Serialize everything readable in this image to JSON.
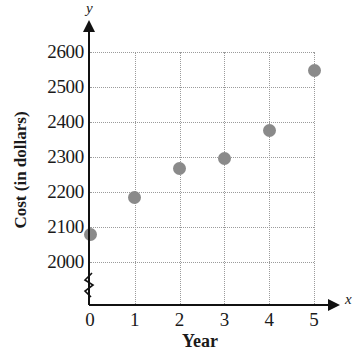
{
  "chart_data": {
    "type": "scatter",
    "title": "",
    "xlabel": "Year",
    "ylabel": "Cost (in dollars)",
    "x_axis_letter": "x",
    "y_axis_letter": "y",
    "x": [
      0,
      1,
      2,
      3,
      4,
      5
    ],
    "values": [
      2080,
      2185,
      2267,
      2295,
      2375,
      2548
    ],
    "series": [
      {
        "name": "Cost",
        "points": [
          {
            "x": 0,
            "y": 2080
          },
          {
            "x": 1,
            "y": 2185
          },
          {
            "x": 2,
            "y": 2267
          },
          {
            "x": 3,
            "y": 2295
          },
          {
            "x": 4,
            "y": 2375
          },
          {
            "x": 5,
            "y": 2548
          }
        ]
      }
    ],
    "xticklabels": [
      "0",
      "1",
      "2",
      "3",
      "4",
      "5"
    ],
    "yticklabels": [
      "2000",
      "2100",
      "2200",
      "2300",
      "2400",
      "2500",
      "2600"
    ],
    "yticks": [
      2000,
      2100,
      2200,
      2300,
      2400,
      2500,
      2600
    ],
    "xlim": [
      0,
      5
    ],
    "ylim": [
      2000,
      2600
    ],
    "grid": true,
    "legend": false,
    "y_axis_break": true,
    "point_color": "#8a8a8a",
    "grid_color": "#9b9b9b",
    "axis_color": "#111111"
  }
}
